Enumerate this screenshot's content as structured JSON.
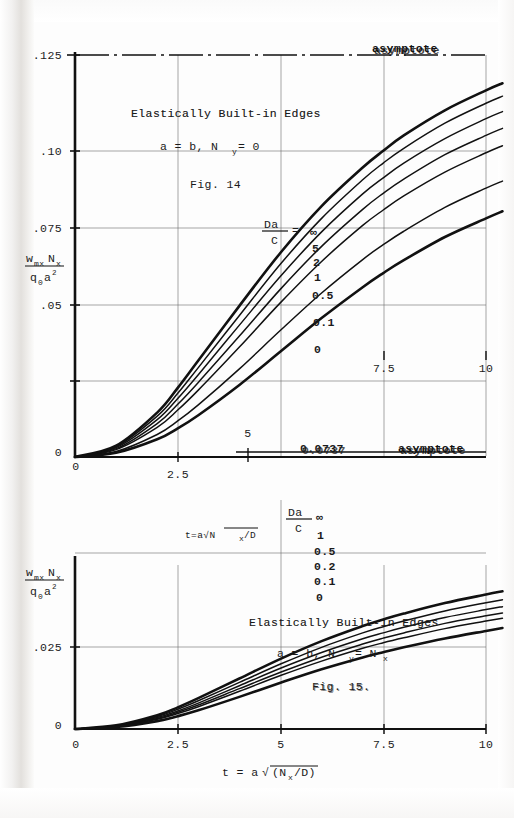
{
  "page": {
    "background": "#fdfdfd",
    "ink": "#1a1a1a"
  },
  "upper_plot": {
    "title": "Elastically Built-in Edges",
    "condition": "a = b,  N",
    "condition_sub": "y",
    "condition_tail": " = 0",
    "figure": "Fig. 14",
    "asymptote_label": "asymptote",
    "asymptote_value": ".125",
    "curve_family_label_num": "Da",
    "curve_family_label_den": "C",
    "curve_family_eq": " = ",
    "ylabel_num_w": "w",
    "ylabel_num_w_sub": "mx",
    "ylabel_num_n": "N",
    "ylabel_num_n_sub": "x",
    "ylabel_den_q": "q",
    "ylabel_den_q_sub": "0",
    "ylabel_den_a": "a",
    "ylabel_den_a_sup": "2",
    "xlabel": "t=a√N",
    "xlabel_sub": "x",
    "xlabel_tail": "/D",
    "yticks": [
      ".125",
      ".10",
      ".075",
      ".05",
      ".025",
      "0"
    ],
    "xticks": [
      "0",
      "2.5",
      "5",
      "7.5",
      "10"
    ]
  },
  "lower_plot": {
    "title": "Elastically Built-in Edges",
    "condition": "a = b,  N",
    "condition_sub": "y",
    "condition_mid": " = N",
    "condition_sub2": "x",
    "figure": "Fig. 15.",
    "asymptote_label": "asymptote",
    "asymptote_value": "0.0737",
    "curve_family_label_num": "Da",
    "curve_family_label_den": "C",
    "ylabel_num_w": "w",
    "ylabel_num_w_sub": "mx",
    "ylabel_num_n": "N",
    "ylabel_num_n_sub": "x",
    "ylabel_den_q": "q",
    "ylabel_den_q_sub": "0",
    "ylabel_den_a": "a",
    "ylabel_den_a_sup": "2",
    "xlabel_head": "t = a",
    "xlabel_radical": "√",
    "xlabel_body": "(N",
    "xlabel_sub": "x",
    "xlabel_tail": "/D)",
    "yticks": [
      ".025",
      "0"
    ],
    "xticks": [
      "0",
      "2.5",
      "5",
      "7.5",
      "10"
    ]
  },
  "chart_data": [
    {
      "type": "line",
      "id": "fig14",
      "title": "Elastically Built-in Edges   a = b,  Ny = 0   Fig. 14",
      "xlabel": "t = a√(Nx/D)",
      "ylabel": "wmx·Nx / (q0·a²)",
      "xlim": [
        0,
        10.5
      ],
      "ylim": [
        0,
        0.125
      ],
      "xticks": [
        0,
        2.5,
        5,
        7.5,
        10
      ],
      "yticks": [
        0,
        0.025,
        0.05,
        0.075,
        0.1,
        0.125
      ],
      "grid": true,
      "legend": "inline-curve-labels",
      "annotations": [
        {
          "text": "asymptote",
          "y": 0.125,
          "x": 9.0
        },
        {
          "text": ".125",
          "y": 0.125,
          "x": 0
        }
      ],
      "series": [
        {
          "name": "∞",
          "x": [
            0,
            1,
            2,
            2.5,
            3,
            4,
            5,
            6,
            7,
            7.5,
            8,
            9,
            10,
            10.4
          ],
          "y": [
            0,
            0.0035,
            0.0138,
            0.0215,
            0.03,
            0.047,
            0.0635,
            0.078,
            0.09,
            0.0952,
            0.1,
            0.1078,
            0.114,
            0.1162
          ]
        },
        {
          "name": "5",
          "x": [
            0,
            1,
            2,
            2.5,
            3,
            4,
            5,
            6,
            7,
            7.5,
            8,
            9,
            10,
            10.4
          ],
          "y": [
            0,
            0.0032,
            0.0127,
            0.0198,
            0.0278,
            0.044,
            0.06,
            0.0742,
            0.0862,
            0.0914,
            0.096,
            0.1038,
            0.11,
            0.1122
          ]
        },
        {
          "name": "2",
          "x": [
            0,
            1,
            2,
            2.5,
            3,
            4,
            5,
            6,
            7,
            7.5,
            8,
            9,
            10,
            10.4
          ],
          "y": [
            0,
            0.0029,
            0.0116,
            0.0182,
            0.0256,
            0.041,
            0.0562,
            0.07,
            0.0818,
            0.0868,
            0.0914,
            0.099,
            0.1052,
            0.1074
          ]
        },
        {
          "name": "1",
          "x": [
            0,
            1,
            2,
            2.5,
            3,
            4,
            5,
            6,
            7,
            7.5,
            8,
            9,
            10,
            10.4
          ],
          "y": [
            0,
            0.0026,
            0.0104,
            0.0164,
            0.0232,
            0.0376,
            0.0522,
            0.0655,
            0.077,
            0.082,
            0.0864,
            0.094,
            0.1,
            0.1022
          ]
        },
        {
          "name": "0.5",
          "x": [
            0,
            1,
            2,
            2.5,
            3,
            4,
            5,
            6,
            7,
            7.5,
            8,
            9,
            10,
            10.4
          ],
          "y": [
            0,
            0.0023,
            0.0092,
            0.0146,
            0.0208,
            0.0342,
            0.048,
            0.0608,
            0.072,
            0.0768,
            0.0812,
            0.0886,
            0.0946,
            0.0968
          ]
        },
        {
          "name": "0.1",
          "x": [
            0,
            1,
            2,
            2.5,
            3,
            4,
            5,
            6,
            7,
            7.5,
            8,
            9,
            10,
            10.4
          ],
          "y": [
            0,
            0.0017,
            0.007,
            0.0112,
            0.0162,
            0.0274,
            0.0394,
            0.051,
            0.0614,
            0.066,
            0.0702,
            0.0776,
            0.0836,
            0.0858
          ]
        },
        {
          "name": "0",
          "x": [
            0,
            1,
            2,
            2.5,
            3,
            4,
            5,
            6,
            7,
            7.5,
            8,
            9,
            10,
            10.4
          ],
          "y": [
            0,
            0.0013,
            0.0055,
            0.0089,
            0.013,
            0.0224,
            0.0328,
            0.0432,
            0.0528,
            0.0572,
            0.0612,
            0.0684,
            0.0742,
            0.0764
          ]
        }
      ],
      "curve_labels": [
        "∞",
        "5",
        "2",
        "1",
        "0.5",
        "0.1",
        "0"
      ]
    },
    {
      "type": "line",
      "id": "fig15",
      "title": "Elastically Built-in Edges   a = b,  Ny = Nx   Fig. 15.",
      "xlabel": "t = a√(Nx/D)",
      "ylabel": "wmx·Nx / (q0·a²)",
      "xlim": [
        0,
        10.5
      ],
      "ylim": [
        0,
        0.045
      ],
      "xticks": [
        0,
        2.5,
        5,
        7.5,
        10
      ],
      "yticks": [
        0,
        0.025
      ],
      "grid": true,
      "legend": "inline-curve-labels",
      "annotations": [
        {
          "text": "asymptote",
          "y": 0.0737,
          "x": 9.0
        },
        {
          "text": "0.0737",
          "y": 0.0737,
          "x": 5.2
        }
      ],
      "series": [
        {
          "name": "∞",
          "x": [
            0,
            1,
            2,
            2.5,
            3,
            4,
            5,
            6,
            7,
            7.5,
            8,
            9,
            10,
            10.4
          ],
          "y": [
            0,
            0.0011,
            0.0042,
            0.0066,
            0.0094,
            0.0154,
            0.0214,
            0.0268,
            0.0314,
            0.0334,
            0.0352,
            0.0384,
            0.041,
            0.042
          ]
        },
        {
          "name": "1",
          "x": [
            0,
            1,
            2,
            2.5,
            3,
            4,
            5,
            6,
            7,
            7.5,
            8,
            9,
            10,
            10.4
          ],
          "y": [
            0,
            0.001,
            0.0038,
            0.006,
            0.0086,
            0.0142,
            0.0198,
            0.0249,
            0.0293,
            0.0312,
            0.0329,
            0.036,
            0.0385,
            0.0394
          ]
        },
        {
          "name": "0.5",
          "x": [
            0,
            1,
            2,
            2.5,
            3,
            4,
            5,
            6,
            7,
            7.5,
            8,
            9,
            10,
            10.4
          ],
          "y": [
            0,
            0.0009,
            0.0035,
            0.0055,
            0.0079,
            0.0132,
            0.0185,
            0.0233,
            0.0275,
            0.0293,
            0.031,
            0.034,
            0.0364,
            0.0373
          ]
        },
        {
          "name": "0.2",
          "x": [
            0,
            1,
            2,
            2.5,
            3,
            4,
            5,
            6,
            7,
            7.5,
            8,
            9,
            10,
            10.4
          ],
          "y": [
            0,
            0.0008,
            0.0032,
            0.0051,
            0.0073,
            0.0123,
            0.0173,
            0.0219,
            0.0259,
            0.0277,
            0.0293,
            0.0322,
            0.0345,
            0.0354
          ]
        },
        {
          "name": "0.1",
          "x": [
            0,
            1,
            2,
            2.5,
            3,
            4,
            5,
            6,
            7,
            7.5,
            8,
            9,
            10,
            10.4
          ],
          "y": [
            0,
            0.00075,
            0.003,
            0.0047,
            0.0068,
            0.0115,
            0.0163,
            0.0207,
            0.0246,
            0.0263,
            0.0278,
            0.0306,
            0.0329,
            0.0338
          ]
        },
        {
          "name": "0",
          "x": [
            0,
            1,
            2,
            2.5,
            3,
            4,
            5,
            6,
            7,
            7.5,
            8,
            9,
            10,
            10.4
          ],
          "y": [
            0,
            0.0006,
            0.0024,
            0.0039,
            0.0057,
            0.0098,
            0.0141,
            0.0182,
            0.0218,
            0.0234,
            0.0249,
            0.0276,
            0.0299,
            0.0308
          ]
        }
      ],
      "curve_labels": [
        "∞",
        "1",
        "0.5",
        "0.2",
        "0.1",
        "0"
      ]
    }
  ]
}
